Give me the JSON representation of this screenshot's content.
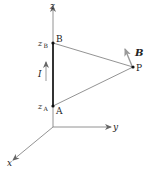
{
  "diagram": {
    "axes": {
      "x_label": "x",
      "y_label": "y",
      "z_label": "z"
    },
    "points": {
      "A": {
        "label": "A",
        "coord_label": "z",
        "coord_sub": "A"
      },
      "B": {
        "label": "B",
        "coord_label": "z",
        "coord_sub": "B"
      },
      "P": {
        "label": "P"
      }
    },
    "current": {
      "label": "I"
    },
    "field": {
      "label": "B"
    },
    "colors": {
      "axis": "#666666",
      "wire": "#333333",
      "lines": "#777777",
      "arrow": "#888888",
      "text": "#222222"
    }
  }
}
